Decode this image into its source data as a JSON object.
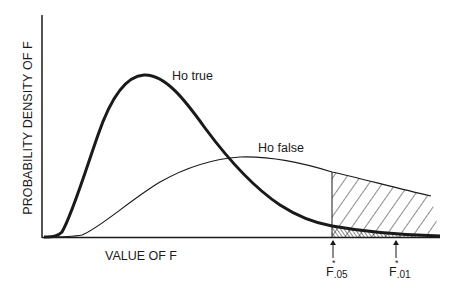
{
  "figure": {
    "y_axis_label": "PROBABILITY DENSITY OF F",
    "x_axis_label": "VALUE OF F",
    "curves": [
      {
        "name": "Ho true",
        "label": "Ho true",
        "style": "thick"
      },
      {
        "name": "Ho false",
        "label": "Ho false",
        "style": "thin"
      }
    ],
    "critical_values": [
      {
        "base": "F",
        "star": "*",
        "subscript": ".05"
      },
      {
        "base": "F",
        "star": "*",
        "subscript": ".01"
      }
    ],
    "shading": {
      "power_region": "hatched area under Ho false curve to the right of F*.05",
      "alpha_region": "cross-hatched area under Ho true curve to the right of F*.05"
    },
    "colors": {
      "ink": "#1a1a1a",
      "background": "#ffffff"
    }
  }
}
